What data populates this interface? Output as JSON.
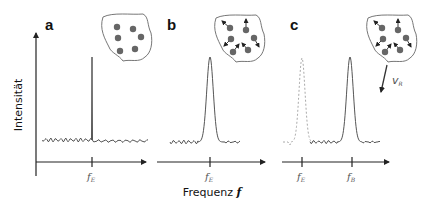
{
  "figure": {
    "y_axis_title": "Intensität",
    "x_axis_title": "Frequenz",
    "x_axis_symbol": "f",
    "colors": {
      "axis": "#222222",
      "curve": "#555555",
      "dashed_curve": "#aaaaaa",
      "particle": "#666666",
      "blob_outline": "#777777"
    },
    "panels": [
      {
        "id": "a",
        "label": "a",
        "description": "stationary particles, narrow line at emitted frequency",
        "particles_moving": false,
        "peak": {
          "type": "narrow-line",
          "at": "fE"
        },
        "ticks": [
          {
            "base": "f",
            "sub": "E"
          }
        ]
      },
      {
        "id": "b",
        "label": "b",
        "description": "thermally moving particles, Doppler-broadened peak at emitted frequency",
        "particles_moving": true,
        "peak": {
          "type": "broadened",
          "at": "fE"
        },
        "ticks": [
          {
            "base": "f",
            "sub": "E"
          }
        ]
      },
      {
        "id": "c",
        "label": "c",
        "description": "moving source, broadened peak shifted from fE to fB",
        "particles_moving": true,
        "source_velocity_label": {
          "base": "v",
          "sub": "R"
        },
        "reference_peak": {
          "type": "broadened-dashed",
          "at": "fE"
        },
        "peak": {
          "type": "broadened",
          "at": "fB"
        },
        "ticks": [
          {
            "base": "f",
            "sub": "E"
          },
          {
            "base": "f",
            "sub": "B"
          }
        ]
      }
    ]
  }
}
